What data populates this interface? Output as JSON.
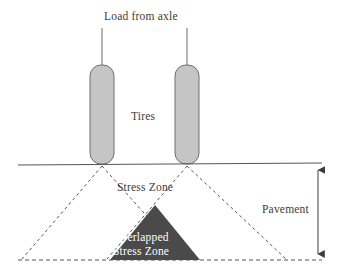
{
  "diagram": {
    "labels": {
      "load_from_axle": "Load from axle",
      "tires": "Tires",
      "stress_zone": "Stress Zone",
      "pavement": "Pavement",
      "overlapped_line1": "Overlapped",
      "overlapped_line2": "Stress Zone"
    },
    "colors": {
      "background": "#ffffff",
      "tire_fill": "#c5c5c5",
      "tire_stroke": "#6e6e6e",
      "overlap_fill": "#4a4a4a",
      "line": "#555555",
      "dashed_line": "#555555",
      "text": "#3b3b3b",
      "overlap_text": "#ffffff"
    },
    "geometry": {
      "ground_line_y": 164,
      "bottom_line_y": 260,
      "ground_line_x1": 18,
      "ground_line_x2": 322,
      "left_tire": {
        "x": 90,
        "y": 65,
        "width": 24,
        "height": 99,
        "radius": 11
      },
      "right_tire": {
        "x": 175,
        "y": 65,
        "width": 24,
        "height": 99,
        "radius": 11
      },
      "left_arrow_x": 102,
      "right_arrow_x": 187,
      "arrow_top_y": 28,
      "arrow_tip_y": 105,
      "left_cone_apex_x": 102,
      "right_cone_apex_x": 187,
      "left_cone_base_x1": 22,
      "left_cone_base_x2": 185,
      "right_cone_base_x1": 107,
      "right_cone_base_x2": 286,
      "overlap_triangle": {
        "apex_x": 155,
        "apex_y": 205,
        "base_x1": 110,
        "base_x2": 200,
        "base_y": 260
      },
      "dimension_arrow_x": 318,
      "dimension_top_y": 164,
      "dimension_bottom_y": 260
    }
  }
}
